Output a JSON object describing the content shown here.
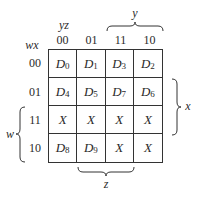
{
  "kmap": {
    "row_var_label": "wx",
    "col_var_label": "yz",
    "col_headers": [
      "00",
      "01",
      "11",
      "10"
    ],
    "row_headers": [
      "00",
      "01",
      "11",
      "10"
    ],
    "cells": [
      [
        {
          "base": "D",
          "sub": "0"
        },
        {
          "base": "D",
          "sub": "1"
        },
        {
          "base": "D",
          "sub": "3"
        },
        {
          "base": "D",
          "sub": "2"
        }
      ],
      [
        {
          "base": "D",
          "sub": "4"
        },
        {
          "base": "D",
          "sub": "5"
        },
        {
          "base": "D",
          "sub": "7"
        },
        {
          "base": "D",
          "sub": "6"
        }
      ],
      [
        {
          "base": "X",
          "sub": ""
        },
        {
          "base": "X",
          "sub": ""
        },
        {
          "base": "X",
          "sub": ""
        },
        {
          "base": "X",
          "sub": ""
        }
      ],
      [
        {
          "base": "D",
          "sub": "8"
        },
        {
          "base": "D",
          "sub": "9"
        },
        {
          "base": "X",
          "sub": ""
        },
        {
          "base": "X",
          "sub": ""
        }
      ]
    ],
    "braces": {
      "y": "y",
      "x": "x",
      "w": "w",
      "z": "z"
    }
  }
}
